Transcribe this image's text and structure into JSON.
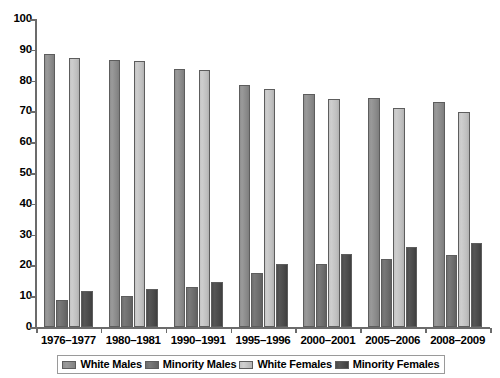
{
  "chart_data": {
    "type": "bar",
    "title": "",
    "subtitle": "",
    "xlabel": "",
    "ylabel": "",
    "ylim": [
      0,
      100
    ],
    "ytick_step": 10,
    "yticks": [
      0,
      10,
      20,
      30,
      40,
      50,
      60,
      70,
      80,
      90,
      100
    ],
    "grid": false,
    "legend_position": "bottom",
    "categories": [
      "1976–1977",
      "1980–1981",
      "1990–1991",
      "1995–1996",
      "2000–2001",
      "2005–2006",
      "2008–2009"
    ],
    "series": [
      {
        "name": "White Males",
        "color": "#8f8f8f",
        "values": [
          88.7,
          86.6,
          83.8,
          78.5,
          75.5,
          74.2,
          73.2
        ]
      },
      {
        "name": "Minority Males",
        "color": "#6e6e6e",
        "values": [
          8.8,
          10.0,
          12.9,
          17.5,
          20.6,
          22.2,
          23.3
        ]
      },
      {
        "name": "White Females",
        "color": "#c4c4c4",
        "values": [
          87.3,
          86.3,
          83.5,
          77.2,
          73.9,
          71.0,
          69.9
        ]
      },
      {
        "name": "Minority Females",
        "color": "#4c4c4c",
        "values": [
          11.7,
          12.3,
          14.6,
          20.3,
          23.6,
          25.9,
          27.4
        ]
      }
    ]
  },
  "legend": {
    "items": [
      {
        "label": "White Males"
      },
      {
        "label": "Minority Males"
      },
      {
        "label": "White Females"
      },
      {
        "label": "Minority Females"
      }
    ]
  }
}
